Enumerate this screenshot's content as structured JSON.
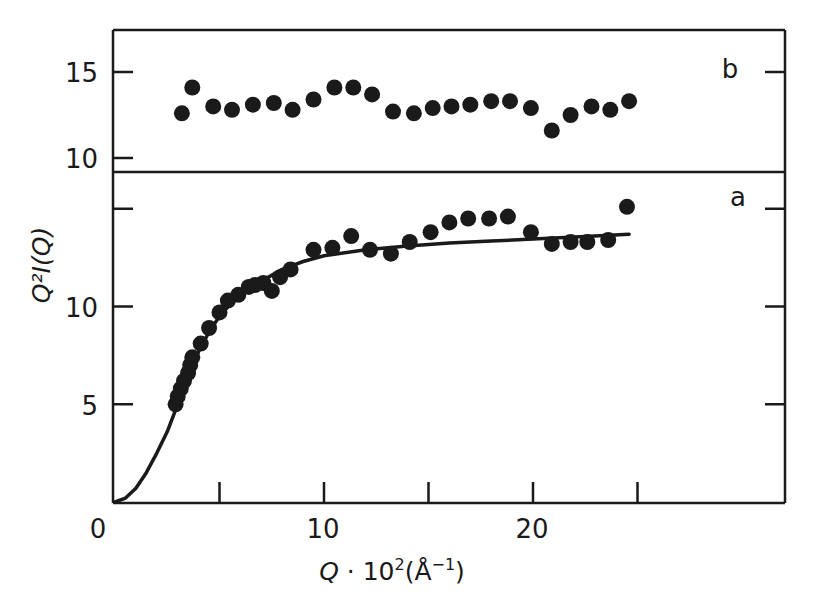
{
  "chart_data": [
    {
      "panel": "b",
      "type": "scatter",
      "title": "",
      "panel_label": "b",
      "xlabel": "",
      "ylabel": "",
      "xlim": [
        0,
        32
      ],
      "ylim": [
        9.5,
        17
      ],
      "yticks": [
        10,
        15
      ],
      "ytick_labels": [
        "10",
        "15"
      ],
      "grid": false,
      "series": [
        {
          "name": "b data",
          "marker": "filled-circle",
          "x": [
            3.2,
            3.7,
            4.7,
            5.6,
            6.6,
            7.6,
            8.5,
            9.5,
            10.5,
            11.4,
            12.3,
            13.3,
            14.3,
            15.2,
            16.1,
            17.0,
            18.0,
            18.9,
            19.9,
            20.9,
            21.8,
            22.8,
            23.7,
            24.6
          ],
          "y": [
            12.6,
            14.1,
            13.0,
            12.8,
            13.1,
            13.2,
            12.8,
            13.4,
            14.1,
            14.1,
            13.7,
            12.7,
            12.6,
            12.9,
            13.0,
            13.1,
            13.3,
            13.3,
            12.9,
            11.6,
            12.5,
            13.0,
            12.8,
            13.3
          ]
        }
      ]
    },
    {
      "panel": "a",
      "type": "scatter",
      "title": "",
      "panel_label": "a",
      "xlabel": "Q · 10²(Å⁻¹)",
      "ylabel": "Q²I(Q)",
      "xlim": [
        0,
        32
      ],
      "ylim": [
        0,
        17
      ],
      "xticks": [
        0,
        5,
        10,
        15,
        20,
        25
      ],
      "xtick_labels": [
        "0",
        "10",
        "20"
      ],
      "xtick_label_values": [
        0,
        10,
        20
      ],
      "yticks": [
        5,
        10,
        15
      ],
      "ytick_labels": [
        "5",
        "10"
      ],
      "grid": false,
      "series": [
        {
          "name": "a data",
          "marker": "filled-circle",
          "x": [
            2.9,
            3.0,
            3.15,
            3.3,
            3.5,
            3.6,
            3.7,
            4.1,
            4.5,
            5.0,
            5.4,
            5.9,
            6.4,
            6.7,
            7.1,
            7.5,
            7.9,
            8.4,
            9.5,
            10.4,
            11.3,
            12.2,
            13.2,
            14.1,
            15.1,
            16.0,
            16.9,
            17.9,
            18.8,
            19.9,
            20.9,
            21.8,
            22.6,
            23.6,
            24.5
          ],
          "y": [
            5.0,
            5.4,
            5.8,
            6.2,
            6.6,
            7.0,
            7.4,
            8.1,
            8.9,
            9.7,
            10.3,
            10.6,
            11.0,
            11.1,
            11.2,
            10.8,
            11.5,
            11.9,
            12.9,
            13.0,
            13.6,
            12.9,
            12.7,
            13.3,
            13.8,
            14.3,
            14.5,
            14.5,
            14.6,
            13.8,
            13.2,
            13.3,
            13.3,
            13.4,
            15.1
          ]
        },
        {
          "name": "fit",
          "type": "line",
          "x": [
            0,
            0.5,
            1,
            1.5,
            2,
            2.5,
            3,
            3.5,
            4,
            4.5,
            5,
            5.5,
            6,
            7,
            8,
            9,
            10,
            12,
            14,
            16,
            18,
            20,
            22,
            24.6
          ],
          "y": [
            0,
            0.2,
            0.7,
            1.5,
            2.5,
            3.6,
            5.0,
            6.4,
            7.7,
            8.7,
            9.5,
            10.1,
            10.6,
            11.3,
            11.9,
            12.3,
            12.6,
            12.9,
            13.1,
            13.25,
            13.35,
            13.45,
            13.55,
            13.7
          ]
        }
      ]
    }
  ],
  "labels": {
    "panel_a": "a",
    "panel_b": "b",
    "xlabel_q": "Q",
    "xlabel_rest": " · 10",
    "xlabel_sup": "2",
    "xlabel_unit": "(Å",
    "xlabel_unit_sup": "−1",
    "xlabel_close": ")",
    "ylabel": "Q²I(Q)",
    "x0": "0",
    "x10": "10",
    "x20": "20",
    "ya5": "5",
    "ya10": "10",
    "yb10": "10",
    "yb15": "15"
  }
}
